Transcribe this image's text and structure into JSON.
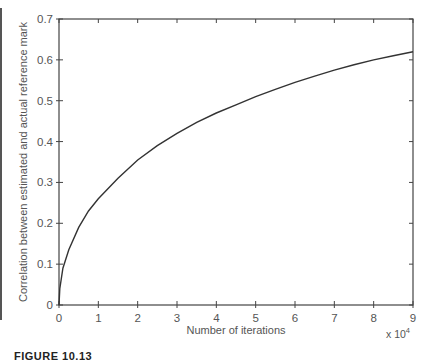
{
  "chart_data": {
    "type": "line",
    "title": "",
    "xlabel": "Number of iterations",
    "x_multiplier_label": "x 10",
    "x_multiplier_exp": "4",
    "ylabel": "Correlation between estimated and actual reference mark",
    "xlim": [
      0,
      9
    ],
    "ylim": [
      0,
      0.7
    ],
    "x_ticks": [
      "0",
      "1",
      "2",
      "3",
      "4",
      "5",
      "6",
      "7",
      "8",
      "9"
    ],
    "y_ticks": [
      "0",
      "0.1",
      "0.2",
      "0.3",
      "0.4",
      "0.5",
      "0.6",
      "0.7"
    ],
    "grid": false,
    "legend": null,
    "series": [
      {
        "name": "correlation",
        "color": "#333333",
        "x": [
          0.0,
          0.02,
          0.1,
          0.25,
          0.5,
          0.75,
          1,
          1.5,
          2,
          2.5,
          3,
          3.5,
          4,
          4.5,
          5,
          5.5,
          6,
          6.5,
          7,
          7.5,
          8,
          8.5,
          9
        ],
        "y": [
          0.0,
          0.04,
          0.09,
          0.135,
          0.19,
          0.23,
          0.26,
          0.31,
          0.355,
          0.39,
          0.42,
          0.447,
          0.47,
          0.49,
          0.51,
          0.528,
          0.545,
          0.56,
          0.575,
          0.588,
          0.6,
          0.61,
          0.62
        ]
      }
    ]
  },
  "caption": {
    "text": "FIGURE 10.13"
  }
}
